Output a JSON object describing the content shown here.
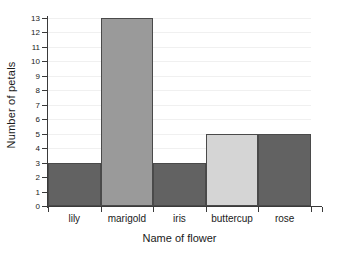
{
  "chart_data": {
    "type": "bar",
    "title": "",
    "xlabel": "Name of flower",
    "ylabel": "Number of petals",
    "categories": [
      "lily",
      "marigold",
      "iris",
      "buttercup",
      "rose"
    ],
    "values": [
      3,
      13,
      3,
      5,
      5
    ],
    "bar_colors": [
      "#626262",
      "#9a9a9a",
      "#626262",
      "#d5d5d5",
      "#626262"
    ],
    "bar_border_color": "#4a4a4a",
    "ylim": [
      0,
      13
    ],
    "ytick_step": 1,
    "ytick_labels": [
      "0",
      "1",
      "2",
      "3",
      "4",
      "5",
      "6",
      "7",
      "8",
      "9",
      "10",
      "11",
      "12",
      "13"
    ],
    "grid": true,
    "gridline_color": "#f0f0f0",
    "axis_color": "#3a3a3a",
    "legend": null,
    "background": "#ffffff",
    "bars_contiguous": true
  }
}
